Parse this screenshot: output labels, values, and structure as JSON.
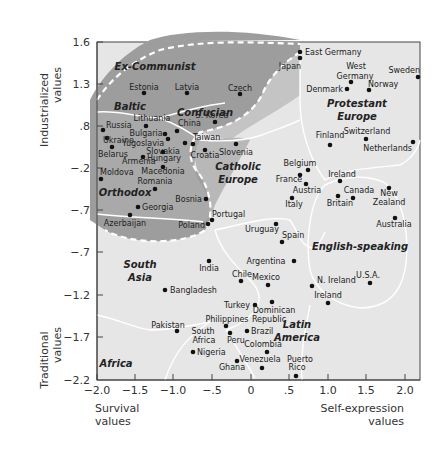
{
  "chart_data": {
    "type": "scatter",
    "title": "",
    "xlabel_left": "Survival values",
    "xlabel_right": "Self-expression values",
    "ylabel_top": "Industrialized values",
    "ylabel_bottom": "Traditional values",
    "x_ticks": [
      "−2.0",
      "−1.5",
      "−1.0",
      "−.5",
      "0",
      ".5",
      "1.0",
      "1.5",
      "2.0"
    ],
    "y_ticks": [
      "1.6",
      "1.3",
      ".8",
      "−.2",
      "−.7",
      "−.7",
      "−1.2",
      "−1.7",
      "−2.2"
    ],
    "xlim": [
      -2.0,
      2.2
    ],
    "ylim": [
      -2.2,
      1.6
    ],
    "grid": false,
    "legend": "none",
    "colors": {
      "plot_bg": "#e6e6e6",
      "region_dark": "#9d9d9d",
      "region_mid": "#bdbdbd",
      "boundary": "#ffffff",
      "dot": "#111111"
    },
    "regions": [
      {
        "name": "Ex-Communist",
        "x": 155,
        "y": 70
      },
      {
        "name": "Baltic",
        "x": 130,
        "y": 110
      },
      {
        "name": "Confucian",
        "x": 205,
        "y": 116
      },
      {
        "name": "Protestant",
        "x": 357,
        "y": 107
      },
      {
        "name": "Europe",
        "x": 357,
        "y": 120
      },
      {
        "name": "Catholic",
        "x": 238,
        "y": 170
      },
      {
        "name": "Europe",
        "x": 238,
        "y": 183
      },
      {
        "name": "Orthodox",
        "x": 125,
        "y": 196
      },
      {
        "name": "English-speaking",
        "x": 360,
        "y": 250
      },
      {
        "name": "South",
        "x": 140,
        "y": 268
      },
      {
        "name": "Asia",
        "x": 140,
        "y": 281
      },
      {
        "name": "Latin",
        "x": 297,
        "y": 328
      },
      {
        "name": "America",
        "x": 297,
        "y": 341
      },
      {
        "name": "Africa",
        "x": 116,
        "y": 367
      }
    ],
    "points": [
      {
        "name": "East Germany",
        "x": 0.6,
        "y": 1.52,
        "px": 300,
        "py": 52,
        "lx": 305,
        "ly": 55,
        "anchor": "start"
      },
      {
        "name": "Japan",
        "x": 0.6,
        "y": 1.42,
        "px": 300,
        "py": 58,
        "lx": 290,
        "ly": 69,
        "anchor": "middle"
      },
      {
        "name": "West Germany",
        "x": 1.3,
        "y": 1.3,
        "px": 351,
        "py": 82,
        "lx": 356,
        "ly": 69,
        "anchor": "middle"
      },
      {
        "name": "Germany",
        "x": 1.3,
        "y": 1.3,
        "px": -1,
        "py": -1,
        "lx": 355,
        "ly": 79,
        "anchor": "middle",
        "label_only": true
      },
      {
        "name": "Sweden",
        "x": 2.2,
        "y": 1.3,
        "px": 418,
        "py": 77,
        "lx": 420,
        "ly": 73,
        "anchor": "end"
      },
      {
        "name": "Denmark",
        "x": 1.2,
        "y": 1.2,
        "px": 347,
        "py": 89,
        "lx": 343,
        "ly": 92,
        "anchor": "end"
      },
      {
        "name": "Norway",
        "x": 1.55,
        "y": 1.18,
        "px": 369,
        "py": 90,
        "lx": 368,
        "ly": 87,
        "anchor": "start"
      },
      {
        "name": "Estonia",
        "x": -1.4,
        "y": 1.1,
        "px": 144,
        "py": 93,
        "lx": 144,
        "ly": 90,
        "anchor": "middle"
      },
      {
        "name": "Latvia",
        "x": -0.85,
        "y": 1.1,
        "px": 187,
        "py": 93,
        "lx": 187,
        "ly": 90,
        "anchor": "middle"
      },
      {
        "name": "Czech",
        "x": -0.2,
        "y": 1.08,
        "px": 240,
        "py": 94,
        "lx": 240,
        "ly": 91,
        "anchor": "middle"
      },
      {
        "name": "Lithuania",
        "x": -1.4,
        "y": 0.8,
        "px": 146,
        "py": 126,
        "lx": 152,
        "ly": 121,
        "anchor": "middle"
      },
      {
        "name": "Russia",
        "x": -1.95,
        "y": 0.8,
        "px": 103,
        "py": 130,
        "lx": 106,
        "ly": 128,
        "anchor": "start"
      },
      {
        "name": "Bulgaria",
        "x": -1.15,
        "y": 0.75,
        "px": 165,
        "py": 134,
        "lx": 146,
        "ly": 136,
        "anchor": "middle"
      },
      {
        "name": "China",
        "x": -1.0,
        "y": 0.72,
        "px": 177,
        "py": 131,
        "lx": 178,
        "ly": 126,
        "anchor": "start"
      },
      {
        "name": "S. Korea",
        "x": -0.4,
        "y": 0.85,
        "px": 215,
        "py": 122,
        "lx": 212,
        "ly": 118,
        "anchor": "middle"
      },
      {
        "name": "Ukraine",
        "x": -1.9,
        "y": 0.7,
        "px": 107,
        "py": 138,
        "lx": 103,
        "ly": 143,
        "anchor": "start"
      },
      {
        "name": "Yugoslavia",
        "x": -1.1,
        "y": 0.65,
        "px": 168,
        "py": 139,
        "lx": 143,
        "ly": 146,
        "anchor": "middle"
      },
      {
        "name": "Taiwan",
        "x": -0.75,
        "y": 0.6,
        "px": 193,
        "py": 144,
        "lx": 193,
        "ly": 140,
        "anchor": "start"
      },
      {
        "name": "Slovakia",
        "x": -0.85,
        "y": 0.55,
        "px": 185,
        "py": 143,
        "lx": 163,
        "ly": 154,
        "anchor": "middle"
      },
      {
        "name": "Croatia",
        "x": -0.6,
        "y": 0.5,
        "px": 205,
        "py": 150,
        "lx": 205,
        "ly": 158,
        "anchor": "middle"
      },
      {
        "name": "Slovenia",
        "x": -0.3,
        "y": 0.5,
        "px": 236,
        "py": 144,
        "lx": 236,
        "ly": 155,
        "anchor": "middle"
      },
      {
        "name": "Belarus",
        "x": -1.9,
        "y": 0.5,
        "px": 112,
        "py": 147,
        "lx": 113,
        "ly": 157,
        "anchor": "middle"
      },
      {
        "name": "Hungary",
        "x": -1.1,
        "y": 0.3,
        "px": 163,
        "py": 152,
        "lx": 164,
        "ly": 161,
        "anchor": "middle"
      },
      {
        "name": "Armenia",
        "x": -1.55,
        "y": 0.4,
        "px": 143,
        "py": 157,
        "lx": 122,
        "ly": 164,
        "anchor": "start"
      },
      {
        "name": "Macedonia",
        "x": -1.0,
        "y": 0.2,
        "px": 163,
        "py": 167,
        "lx": 163,
        "ly": 174,
        "anchor": "middle"
      },
      {
        "name": "Moldova",
        "x": -1.95,
        "y": 0.1,
        "px": 101,
        "py": 179,
        "lx": 100,
        "ly": 175,
        "anchor": "start"
      },
      {
        "name": "Romania",
        "x": -1.35,
        "y": 0.0,
        "px": 155,
        "py": 189,
        "lx": 155,
        "ly": 184,
        "anchor": "middle"
      },
      {
        "name": "Bosnia",
        "x": -0.5,
        "y": -0.1,
        "px": 206,
        "py": 199,
        "lx": 202,
        "ly": 202,
        "anchor": "end"
      },
      {
        "name": "Georgia",
        "x": -1.4,
        "y": -0.3,
        "px": 138,
        "py": 207,
        "lx": 142,
        "ly": 210,
        "anchor": "start"
      },
      {
        "name": "Azerbaijan",
        "x": -1.6,
        "y": -0.5,
        "px": 130,
        "py": 215,
        "lx": 125,
        "ly": 226,
        "anchor": "middle"
      },
      {
        "name": "Portugal",
        "x": -0.55,
        "y": -0.45,
        "px": 212,
        "py": 220,
        "lx": 212,
        "ly": 217,
        "anchor": "start"
      },
      {
        "name": "Poland",
        "x": -0.6,
        "y": -0.5,
        "px": 208,
        "py": 224,
        "lx": 205,
        "ly": 228,
        "anchor": "end"
      },
      {
        "name": "Finland",
        "x": 1.0,
        "y": 0.45,
        "px": 330,
        "py": 145,
        "lx": 330,
        "ly": 138,
        "anchor": "middle"
      },
      {
        "name": "Switzerland",
        "x": 1.55,
        "y": 0.55,
        "px": 366,
        "py": 139,
        "lx": 367,
        "ly": 134,
        "anchor": "middle"
      },
      {
        "name": "Netherlands",
        "x": 2.15,
        "y": 0.45,
        "px": 413,
        "py": 142,
        "lx": 412,
        "ly": 151,
        "anchor": "end"
      },
      {
        "name": "Belgium",
        "x": 0.55,
        "y": 0.25,
        "px": 308,
        "py": 170,
        "lx": 300,
        "ly": 166,
        "anchor": "middle"
      },
      {
        "name": "France",
        "x": 0.4,
        "y": 0.2,
        "px": 300,
        "py": 175,
        "lx": 289,
        "ly": 182,
        "anchor": "middle"
      },
      {
        "name": "Austria",
        "x": 0.5,
        "y": 0.1,
        "px": 306,
        "py": 184,
        "lx": 307,
        "ly": 193,
        "anchor": "middle"
      },
      {
        "name": "Italy",
        "x": 0.35,
        "y": -0.05,
        "px": 292,
        "py": 198,
        "lx": 294,
        "ly": 207,
        "anchor": "middle"
      },
      {
        "name": "Ireland",
        "x": 0.95,
        "y": 0.1,
        "px": 340,
        "py": 181,
        "lx": 342,
        "ly": 177,
        "anchor": "middle"
      },
      {
        "name": "Canada",
        "x": 1.25,
        "y": -0.1,
        "px": 353,
        "py": 198,
        "lx": 359,
        "ly": 193,
        "anchor": "middle"
      },
      {
        "name": "Britain",
        "x": 1.1,
        "y": -0.1,
        "px": 338,
        "py": 196,
        "lx": 340,
        "ly": 206,
        "anchor": "middle"
      },
      {
        "name": "New Zealand",
        "x": 1.9,
        "y": 0.05,
        "px": 389,
        "py": 188,
        "lx": 389,
        "ly": 196,
        "anchor": "middle"
      },
      {
        "name": "Zealand",
        "x": 1.9,
        "y": 0.05,
        "px": -1,
        "py": -1,
        "lx": 389,
        "ly": 205,
        "anchor": "middle",
        "label_only": true
      },
      {
        "name": "Australia",
        "x": 2.0,
        "y": -0.3,
        "px": 395,
        "py": 218,
        "lx": 394,
        "ly": 227,
        "anchor": "middle"
      },
      {
        "name": "Uruguay",
        "x": 0.35,
        "y": -0.5,
        "px": 276,
        "py": 224,
        "lx": 262,
        "ly": 232,
        "anchor": "middle"
      },
      {
        "name": "Spain",
        "x": 0.4,
        "y": -0.65,
        "px": 282,
        "py": 242,
        "lx": 282,
        "ly": 238,
        "anchor": "start"
      },
      {
        "name": "India",
        "x": -0.5,
        "y": -0.75,
        "px": 209,
        "py": 261,
        "lx": 209,
        "ly": 271,
        "anchor": "middle"
      },
      {
        "name": "Argentina",
        "x": 0.55,
        "y": -0.9,
        "px": 294,
        "py": 261,
        "lx": 266,
        "ly": 264,
        "anchor": "middle"
      },
      {
        "name": "Chile",
        "x": -0.25,
        "y": -1.0,
        "px": 241,
        "py": 281,
        "lx": 242,
        "ly": 277,
        "anchor": "middle"
      },
      {
        "name": "Mexico",
        "x": 0.1,
        "y": -1.05,
        "px": 268,
        "py": 285,
        "lx": 266,
        "ly": 280,
        "anchor": "middle"
      },
      {
        "name": "Bangladesh",
        "x": -1.1,
        "y": -1.15,
        "px": 165,
        "py": 290,
        "lx": 170,
        "ly": 293,
        "anchor": "start"
      },
      {
        "name": "N. Ireland",
        "x": 0.85,
        "y": -1.1,
        "px": 312,
        "py": 286,
        "lx": 317,
        "ly": 283,
        "anchor": "start"
      },
      {
        "name": "U.S.A.",
        "x": 1.6,
        "y": -1.1,
        "px": 370,
        "py": 283,
        "lx": 368,
        "ly": 278,
        "anchor": "middle"
      },
      {
        "name": "Ireland",
        "x": 1.0,
        "y": -1.3,
        "px": 328,
        "py": 303,
        "lx": 328,
        "ly": 298,
        "anchor": "middle"
      },
      {
        "name": "Turkey",
        "x": -0.3,
        "y": -1.3,
        "px": 255,
        "py": 305,
        "lx": 250,
        "ly": 308,
        "anchor": "end"
      },
      {
        "name": "Dominican Republic",
        "x": 0.15,
        "y": -1.25,
        "px": 272,
        "py": 302,
        "lx": 274,
        "ly": 313,
        "anchor": "middle"
      },
      {
        "name": "Republic",
        "x": 0.15,
        "y": -1.25,
        "px": -1,
        "py": -1,
        "lx": 269,
        "ly": 322,
        "anchor": "middle",
        "label_only": true
      },
      {
        "name": "Philippines",
        "x": -0.55,
        "y": -1.5,
        "px": 226,
        "py": 326,
        "lx": 227,
        "ly": 322,
        "anchor": "middle"
      },
      {
        "name": "Pakistan",
        "x": -0.95,
        "y": -1.5,
        "px": 177,
        "py": 331,
        "lx": 168,
        "ly": 328,
        "anchor": "middle"
      },
      {
        "name": "South Africa",
        "x": -0.55,
        "y": -1.6,
        "px": -1,
        "py": -1,
        "lx": 203,
        "ly": 334,
        "anchor": "middle",
        "label_only": true
      },
      {
        "name": "Africa",
        "x": -0.55,
        "y": -1.6,
        "px": -1,
        "py": -1,
        "lx": 204,
        "ly": 343,
        "anchor": "middle",
        "label_only": true
      },
      {
        "name": "Peru",
        "x": -0.3,
        "y": -1.65,
        "px": 230,
        "py": 333,
        "lx": 236,
        "ly": 343,
        "anchor": "middle"
      },
      {
        "name": "Brazil",
        "x": -0.1,
        "y": -1.6,
        "px": 247,
        "py": 331,
        "lx": 251,
        "ly": 334,
        "anchor": "start"
      },
      {
        "name": "Nigeria",
        "x": -0.75,
        "y": -1.9,
        "px": 193,
        "py": 352,
        "lx": 197,
        "ly": 355,
        "anchor": "start"
      },
      {
        "name": "Colombia",
        "x": 0.05,
        "y": -1.9,
        "px": 267,
        "py": 352,
        "lx": 263,
        "ly": 347,
        "anchor": "middle"
      },
      {
        "name": "Ghana",
        "x": -0.3,
        "y": -2.0,
        "px": 237,
        "py": 361,
        "lx": 232,
        "ly": 370,
        "anchor": "middle"
      },
      {
        "name": "Venezuela",
        "x": 0.2,
        "y": -2.05,
        "px": 262,
        "py": 368,
        "lx": 260,
        "ly": 362,
        "anchor": "middle"
      },
      {
        "name": "Puerto Rico",
        "x": 0.6,
        "y": -2.15,
        "px": 296,
        "py": 376,
        "lx": 300,
        "ly": 362,
        "anchor": "middle"
      },
      {
        "name": "Rico",
        "x": 0.6,
        "y": -2.15,
        "px": -1,
        "py": -1,
        "lx": 297,
        "ly": 370,
        "anchor": "middle",
        "label_only": true
      }
    ]
  }
}
